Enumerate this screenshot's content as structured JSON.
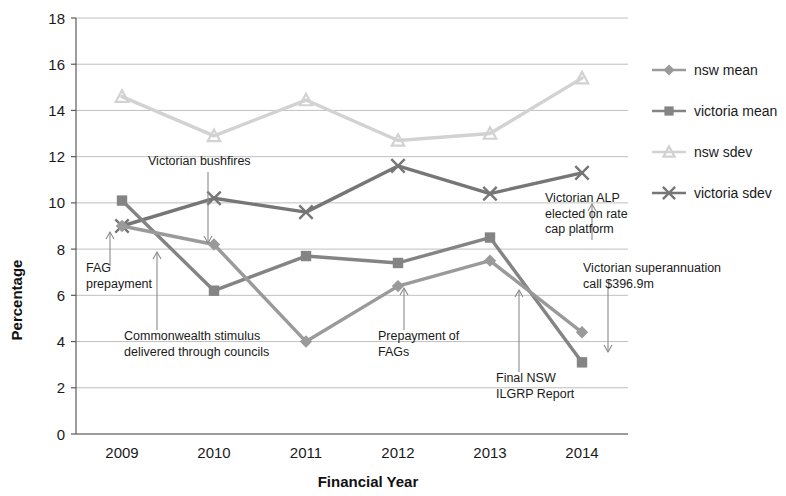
{
  "chart_data": {
    "type": "line",
    "title": "",
    "xlabel": "Financial Year",
    "ylabel": "Percentage",
    "categories": [
      "2009",
      "2010",
      "2011",
      "2012",
      "2013",
      "2014"
    ],
    "x": [
      2009,
      2010,
      2011,
      2012,
      2013,
      2014
    ],
    "xlim": [
      2008.6,
      2014.4
    ],
    "ylim": [
      0,
      18
    ],
    "yticks": [
      0,
      2,
      4,
      6,
      8,
      10,
      12,
      14,
      16,
      18
    ],
    "ytick_labels": [
      "0",
      "2",
      "4",
      "6",
      "8",
      "10",
      "12",
      "14",
      "16",
      "18"
    ],
    "grid": true,
    "grid_axis": "y",
    "legend_position": "right",
    "series": [
      {
        "name": "nsw mean",
        "marker": "diamond",
        "color": "#9a9a9a",
        "values": [
          9.0,
          8.2,
          4.0,
          6.4,
          7.5,
          4.4
        ]
      },
      {
        "name": "victoria mean",
        "marker": "square",
        "color": "#848484",
        "values": [
          10.1,
          6.2,
          7.7,
          7.4,
          8.5,
          3.1
        ]
      },
      {
        "name": "nsw sdev",
        "marker": "triangle",
        "color": "#d2d2d2",
        "values": [
          14.6,
          12.9,
          14.45,
          12.7,
          13.0,
          15.4
        ]
      },
      {
        "name": "victoria sdev",
        "marker": "x",
        "color": "#767676",
        "values": [
          9.0,
          10.2,
          9.6,
          11.6,
          10.4,
          11.3
        ]
      }
    ],
    "annotations": [
      {
        "id": "fag-prepayment",
        "text_lines": [
          "FAG",
          "prepayment"
        ],
        "text_x": 86,
        "text_y": 272,
        "arrow_from_x": 110,
        "arrow_from_y": 266,
        "arrow_to_x": 110,
        "arrow_to_y": 232,
        "arrow_dir": "up"
      },
      {
        "id": "victorian-bushfires",
        "text_lines": [
          "Victorian bushfires"
        ],
        "text_x": 148,
        "text_y": 165,
        "arrow_from_x": 208,
        "arrow_from_y": 172,
        "arrow_to_x": 208,
        "arrow_to_y": 243,
        "arrow_dir": "down"
      },
      {
        "id": "commonwealth-stimulus",
        "text_lines": [
          "Commonwealth stimulus",
          "delivered through councils"
        ],
        "text_x": 124,
        "text_y": 340,
        "arrow_from_x": 157,
        "arrow_from_y": 330,
        "arrow_to_x": 157,
        "arrow_to_y": 252,
        "arrow_dir": "up"
      },
      {
        "id": "prepayment-of-fags",
        "text_lines": [
          "Prepayment of",
          "FAGs"
        ],
        "text_x": 378,
        "text_y": 340,
        "arrow_from_x": 404,
        "arrow_from_y": 330,
        "arrow_to_x": 404,
        "arrow_to_y": 288,
        "arrow_dir": "up"
      },
      {
        "id": "final-nsw-ilgrp-report",
        "text_lines": [
          "Final NSW",
          "ILGRP Report"
        ],
        "text_x": 496,
        "text_y": 382,
        "arrow_from_x": 519,
        "arrow_from_y": 372,
        "arrow_to_x": 519,
        "arrow_to_y": 290,
        "arrow_dir": "up"
      },
      {
        "id": "victorian-alp-rate-cap",
        "text_lines": [
          "Victorian ALP",
          "elected on rate",
          "cap platform"
        ],
        "text_x": 545,
        "text_y": 202,
        "arrow_from_x": 592,
        "arrow_from_y": 240,
        "arrow_to_x": 592,
        "arrow_to_y": 204,
        "arrow_dir": "up"
      },
      {
        "id": "victorian-superannuation",
        "text_lines": [
          "Victorian superannuation",
          "call $396.9m"
        ],
        "text_x": 583,
        "text_y": 272,
        "arrow_from_x": 608,
        "arrow_from_y": 288,
        "arrow_to_x": 608,
        "arrow_to_y": 352,
        "arrow_dir": "down"
      }
    ]
  },
  "legend": {
    "items": [
      {
        "label": "nsw mean"
      },
      {
        "label": "victoria mean"
      },
      {
        "label": "nsw sdev"
      },
      {
        "label": "victoria sdev"
      }
    ]
  }
}
